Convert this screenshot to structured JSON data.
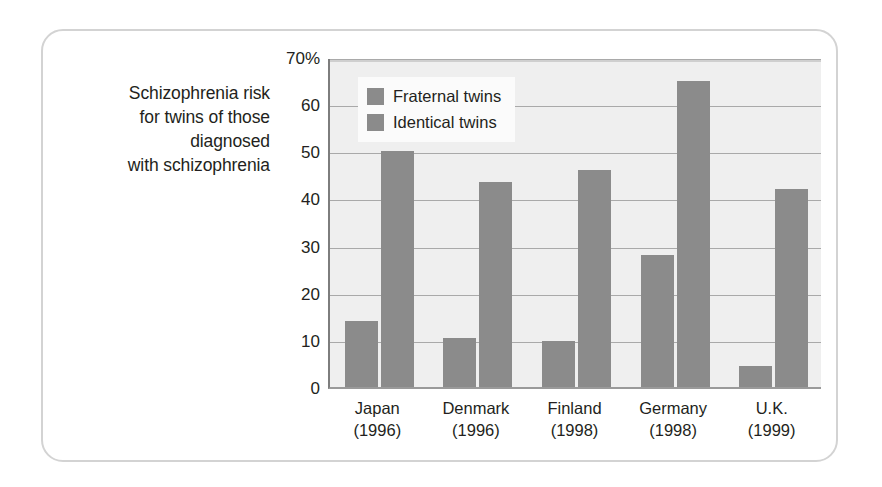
{
  "figure": {
    "caption_lines": [
      "Schizophrenia risk",
      "for twins of those",
      "diagnosed",
      "with schizophrenia"
    ]
  },
  "colors": {
    "bar_gray": "#8b8b8b",
    "plot_background": "#efefef",
    "gridline": "#a9a9a9",
    "card_border": "#d3d3d3",
    "text": "#231f20"
  },
  "chart_data": {
    "type": "bar",
    "title": "",
    "subtitle": "",
    "xlabel": "",
    "ylabel": "",
    "ylim": [
      0,
      70
    ],
    "yticks": [
      0,
      10,
      20,
      30,
      40,
      50,
      60,
      70
    ],
    "ytick_labels": [
      "0",
      "10",
      "20",
      "30",
      "40",
      "50",
      "60",
      "70%"
    ],
    "grid": true,
    "legend_position": "top-left-inside",
    "categories": [
      "Japan (1996)",
      "Denmark (1996)",
      "Finland (1998)",
      "Germany (1998)",
      "U.K. (1999)"
    ],
    "category_lines": [
      [
        "Japan",
        "(1996)"
      ],
      [
        "Denmark",
        "(1996)"
      ],
      [
        "Finland",
        "(1998)"
      ],
      [
        "Germany",
        "(1998)"
      ],
      [
        "U.K.",
        "(1999)"
      ]
    ],
    "series": [
      {
        "name": "Fraternal twins",
        "values": [
          14,
          10.5,
          9.8,
          28,
          4.5
        ]
      },
      {
        "name": "Identical twins",
        "values": [
          50,
          43.5,
          46,
          65,
          42
        ]
      }
    ]
  }
}
